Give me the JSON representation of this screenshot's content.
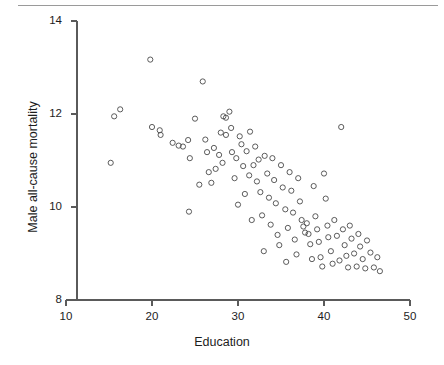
{
  "chart_data": {
    "type": "scatter",
    "title": "",
    "xlabel": "Education",
    "ylabel": "Male all-cause mortality",
    "xlim": [
      10,
      50
    ],
    "ylim": [
      8,
      14
    ],
    "xticks": [
      10,
      20,
      30,
      40,
      50
    ],
    "yticks": [
      8,
      10,
      12,
      14
    ],
    "xtick_labels": [
      "10",
      "20",
      "30",
      "40",
      "50"
    ],
    "ytick_labels": [
      "8",
      "10",
      "12",
      "14"
    ],
    "grid": false,
    "legend": null,
    "marker": "open-circle",
    "marker_color": "#4a4a4a",
    "points": [
      [
        15.6,
        11.95
      ],
      [
        16.3,
        12.1
      ],
      [
        15.2,
        10.95
      ],
      [
        19.8,
        13.17
      ],
      [
        20.0,
        11.72
      ],
      [
        20.9,
        11.65
      ],
      [
        21.0,
        11.55
      ],
      [
        22.4,
        11.38
      ],
      [
        23.1,
        11.32
      ],
      [
        23.6,
        11.3
      ],
      [
        24.2,
        11.44
      ],
      [
        24.4,
        11.05
      ],
      [
        24.3,
        9.9
      ],
      [
        25.0,
        11.9
      ],
      [
        25.9,
        12.7
      ],
      [
        26.2,
        11.45
      ],
      [
        26.4,
        11.18
      ],
      [
        26.6,
        10.75
      ],
      [
        26.9,
        10.52
      ],
      [
        27.2,
        11.27
      ],
      [
        27.4,
        10.82
      ],
      [
        27.8,
        11.12
      ],
      [
        28.0,
        11.6
      ],
      [
        28.3,
        11.95
      ],
      [
        28.6,
        11.92
      ],
      [
        28.6,
        11.55
      ],
      [
        29.0,
        12.05
      ],
      [
        29.2,
        11.7
      ],
      [
        29.3,
        11.18
      ],
      [
        29.6,
        10.62
      ],
      [
        29.8,
        11.05
      ],
      [
        30.2,
        11.52
      ],
      [
        30.4,
        11.35
      ],
      [
        30.6,
        10.88
      ],
      [
        30.8,
        10.28
      ],
      [
        31.0,
        11.2
      ],
      [
        31.3,
        10.68
      ],
      [
        31.4,
        11.62
      ],
      [
        31.8,
        10.9
      ],
      [
        32.0,
        11.3
      ],
      [
        32.2,
        10.55
      ],
      [
        32.4,
        11.02
      ],
      [
        32.6,
        10.32
      ],
      [
        32.8,
        9.82
      ],
      [
        33.1,
        11.1
      ],
      [
        33.4,
        10.72
      ],
      [
        33.6,
        10.2
      ],
      [
        33.8,
        9.62
      ],
      [
        34.0,
        11.05
      ],
      [
        34.2,
        10.58
      ],
      [
        34.4,
        10.08
      ],
      [
        34.6,
        9.4
      ],
      [
        34.8,
        9.18
      ],
      [
        35.0,
        10.9
      ],
      [
        35.2,
        10.42
      ],
      [
        35.5,
        9.95
      ],
      [
        35.8,
        9.55
      ],
      [
        36.0,
        10.75
      ],
      [
        36.2,
        10.35
      ],
      [
        36.4,
        9.88
      ],
      [
        36.6,
        9.3
      ],
      [
        36.8,
        8.98
      ],
      [
        37.0,
        10.62
      ],
      [
        37.2,
        10.12
      ],
      [
        37.4,
        9.72
      ],
      [
        37.6,
        9.58
      ],
      [
        37.8,
        9.45
      ],
      [
        38.0,
        9.65
      ],
      [
        38.2,
        9.42
      ],
      [
        38.4,
        9.2
      ],
      [
        38.6,
        8.88
      ],
      [
        38.8,
        10.45
      ],
      [
        39.0,
        9.8
      ],
      [
        39.2,
        9.52
      ],
      [
        39.4,
        9.25
      ],
      [
        39.6,
        8.92
      ],
      [
        39.8,
        8.72
      ],
      [
        40.0,
        10.72
      ],
      [
        40.2,
        10.18
      ],
      [
        40.4,
        9.6
      ],
      [
        40.5,
        9.35
      ],
      [
        40.8,
        9.05
      ],
      [
        41.0,
        8.78
      ],
      [
        41.2,
        9.72
      ],
      [
        41.5,
        9.38
      ],
      [
        41.8,
        8.85
      ],
      [
        42.0,
        11.72
      ],
      [
        42.2,
        9.52
      ],
      [
        42.4,
        9.18
      ],
      [
        42.6,
        8.95
      ],
      [
        42.8,
        8.7
      ],
      [
        43.0,
        9.6
      ],
      [
        43.2,
        9.32
      ],
      [
        43.5,
        9.0
      ],
      [
        43.8,
        8.72
      ],
      [
        44.0,
        9.42
      ],
      [
        44.2,
        9.15
      ],
      [
        44.5,
        8.88
      ],
      [
        44.8,
        8.68
      ],
      [
        45.0,
        9.28
      ],
      [
        45.4,
        9.02
      ],
      [
        45.8,
        8.7
      ],
      [
        46.2,
        8.92
      ],
      [
        46.5,
        8.62
      ],
      [
        30.0,
        10.05
      ],
      [
        28.2,
        10.95
      ],
      [
        25.5,
        10.48
      ],
      [
        33.0,
        9.05
      ],
      [
        35.6,
        8.82
      ],
      [
        31.6,
        9.72
      ]
    ]
  },
  "figure": {
    "top_rule": true
  }
}
